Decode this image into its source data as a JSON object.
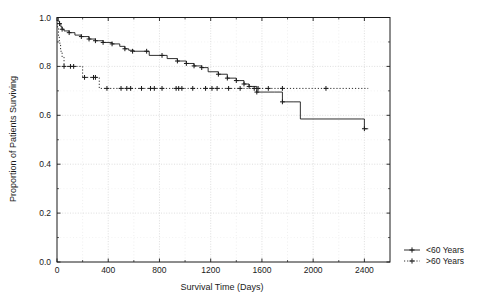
{
  "chart_data": {
    "type": "line",
    "title": "",
    "subtitle": "",
    "xlabel": "Survival Time (Days)",
    "ylabel": "Proportion of Patients Surviving",
    "xlim": [
      0,
      2600
    ],
    "ylim": [
      0.0,
      1.0
    ],
    "xticks": [
      0,
      400,
      800,
      1200,
      1600,
      2000,
      2400
    ],
    "xticklabels": [
      "0",
      "400",
      "800",
      "1200",
      "1600",
      "2000",
      "2400"
    ],
    "yticks": [
      0.0,
      0.2,
      0.4,
      0.6,
      0.8,
      1.0
    ],
    "yticklabels": [
      "0.0",
      "0.2",
      "0.4",
      "0.6",
      "0.8",
      "1.0"
    ],
    "grid": true,
    "grid_style": "dotted",
    "grid_color": "#c8c8c8",
    "minor_ticks": true,
    "legend_position": "outside-right-bottom",
    "series": [
      {
        "name": "<60 Years",
        "label": "<60 Years",
        "linestyle": "solid",
        "color": "#1a1a1a",
        "marker": "plus",
        "step": "post",
        "points": [
          [
            0,
            1.0
          ],
          [
            10,
            0.985
          ],
          [
            20,
            0.975
          ],
          [
            30,
            0.962
          ],
          [
            40,
            0.952
          ],
          [
            55,
            0.945
          ],
          [
            95,
            0.938
          ],
          [
            140,
            0.928
          ],
          [
            190,
            0.922
          ],
          [
            250,
            0.912
          ],
          [
            300,
            0.905
          ],
          [
            360,
            0.898
          ],
          [
            430,
            0.892
          ],
          [
            490,
            0.882
          ],
          [
            530,
            0.872
          ],
          [
            560,
            0.866
          ],
          [
            600,
            0.862
          ],
          [
            700,
            0.862
          ],
          [
            720,
            0.845
          ],
          [
            820,
            0.845
          ],
          [
            860,
            0.832
          ],
          [
            940,
            0.822
          ],
          [
            1010,
            0.812
          ],
          [
            1070,
            0.802
          ],
          [
            1130,
            0.795
          ],
          [
            1180,
            0.778
          ],
          [
            1260,
            0.768
          ],
          [
            1330,
            0.752
          ],
          [
            1400,
            0.742
          ],
          [
            1460,
            0.728
          ],
          [
            1500,
            0.718
          ],
          [
            1560,
            0.695
          ],
          [
            1700,
            0.695
          ],
          [
            1760,
            0.655
          ],
          [
            1850,
            0.655
          ],
          [
            1900,
            0.585
          ],
          [
            2380,
            0.585
          ],
          [
            2400,
            0.545
          ],
          [
            2430,
            0.545
          ]
        ],
        "censor_marks": [
          [
            20,
            0.975
          ],
          [
            40,
            0.952
          ],
          [
            95,
            0.938
          ],
          [
            190,
            0.922
          ],
          [
            250,
            0.912
          ],
          [
            300,
            0.905
          ],
          [
            360,
            0.898
          ],
          [
            430,
            0.892
          ],
          [
            530,
            0.872
          ],
          [
            590,
            0.862
          ],
          [
            700,
            0.862
          ],
          [
            820,
            0.845
          ],
          [
            940,
            0.822
          ],
          [
            1010,
            0.812
          ],
          [
            1070,
            0.802
          ],
          [
            1130,
            0.795
          ],
          [
            1260,
            0.768
          ],
          [
            1330,
            0.752
          ],
          [
            1400,
            0.742
          ],
          [
            1460,
            0.728
          ],
          [
            1500,
            0.718
          ],
          [
            1560,
            0.695
          ],
          [
            1760,
            0.655
          ],
          [
            2400,
            0.545
          ]
        ]
      },
      {
        "name": ">60 Years",
        "label": ">60 Years",
        "linestyle": "dotted",
        "color": "#1a1a1a",
        "marker": "plus",
        "step": "post",
        "points": [
          [
            0,
            1.0
          ],
          [
            5,
            0.955
          ],
          [
            12,
            0.925
          ],
          [
            18,
            0.895
          ],
          [
            28,
            0.862
          ],
          [
            40,
            0.838
          ],
          [
            55,
            0.8
          ],
          [
            180,
            0.8
          ],
          [
            200,
            0.755
          ],
          [
            300,
            0.755
          ],
          [
            330,
            0.71
          ],
          [
            2430,
            0.71
          ]
        ],
        "censor_marks": [
          [
            55,
            0.8
          ],
          [
            105,
            0.8
          ],
          [
            130,
            0.8
          ],
          [
            215,
            0.755
          ],
          [
            285,
            0.755
          ],
          [
            300,
            0.755
          ],
          [
            390,
            0.71
          ],
          [
            500,
            0.71
          ],
          [
            545,
            0.71
          ],
          [
            575,
            0.71
          ],
          [
            660,
            0.71
          ],
          [
            730,
            0.71
          ],
          [
            760,
            0.71
          ],
          [
            820,
            0.71
          ],
          [
            930,
            0.71
          ],
          [
            950,
            0.71
          ],
          [
            975,
            0.71
          ],
          [
            1060,
            0.71
          ],
          [
            1160,
            0.71
          ],
          [
            1210,
            0.71
          ],
          [
            1250,
            0.71
          ],
          [
            1340,
            0.71
          ],
          [
            1430,
            0.71
          ],
          [
            1540,
            0.71
          ],
          [
            1570,
            0.71
          ],
          [
            1650,
            0.71
          ],
          [
            1760,
            0.71
          ],
          [
            2100,
            0.71
          ]
        ]
      }
    ]
  },
  "legend": {
    "items": [
      {
        "label": "<60 Years",
        "linestyle": "solid",
        "marker": "plus"
      },
      {
        "label": ">60 Years",
        "linestyle": "dotted",
        "marker": "plus"
      }
    ]
  }
}
